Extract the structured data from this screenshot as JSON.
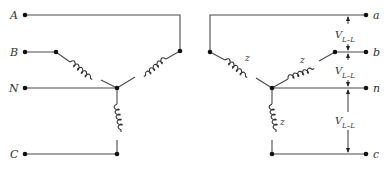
{
  "diagram": {
    "type": "circuit-schematic",
    "primary": {
      "terminals": [
        "A",
        "B",
        "N",
        "C"
      ]
    },
    "secondary": {
      "terminals": [
        "a",
        "b",
        "n",
        "c"
      ],
      "impedance_label": "z",
      "voltage_labels": {
        "main": "V",
        "sub": "L–L"
      }
    }
  }
}
